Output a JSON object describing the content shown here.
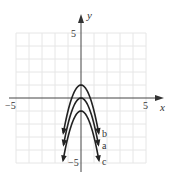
{
  "chart_data": {
    "type": "line",
    "title": "",
    "xlabel": "x",
    "ylabel": "y",
    "xlim": [
      -5,
      5
    ],
    "ylim": [
      -5,
      5
    ],
    "grid": true,
    "x_ticks": [
      {
        "value": -5,
        "label": "−5"
      },
      {
        "value": 5,
        "label": "5"
      }
    ],
    "y_ticks": [
      {
        "value": 5,
        "label": "5"
      },
      {
        "value": -5,
        "label": "−5"
      }
    ],
    "series": [
      {
        "name": "b",
        "equation": "y = -2x^2 + 1",
        "a": -2,
        "k": 1,
        "label": "b"
      },
      {
        "name": "a",
        "equation": "y = -2x^2",
        "a": -2,
        "k": 0,
        "label": "a"
      },
      {
        "name": "c",
        "equation": "y = -2x^2 - 1",
        "a": -2,
        "k": -1,
        "label": "c"
      }
    ]
  },
  "labels": {
    "x_axis": "x",
    "y_axis": "y",
    "x_min": "−5",
    "x_max": "5",
    "y_max": "5",
    "y_min": "−5",
    "curve_b": "b",
    "curve_a": "a",
    "curve_c": "c"
  },
  "colors": {
    "curve": "#222222",
    "axis": "#444444",
    "grid": "#e6e6e6"
  }
}
